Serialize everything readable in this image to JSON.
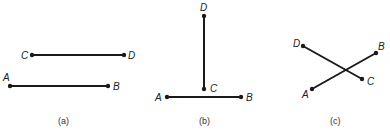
{
  "figure": {
    "panels": [
      {
        "caption": "(a)",
        "caption_pos": [
          65,
          124
        ],
        "segments": [
          {
            "name": "CD",
            "from": "C",
            "to": "D"
          },
          {
            "name": "AB",
            "from": "A",
            "to": "B"
          }
        ],
        "points": {
          "C": {
            "label": "C",
            "x": 32,
            "y": 55,
            "lx": 21,
            "ly": 59
          },
          "D": {
            "label": "D",
            "x": 124,
            "y": 55,
            "lx": 128,
            "ly": 59
          },
          "A": {
            "label": "A",
            "x": 10,
            "y": 86,
            "lx": 3,
            "ly": 81
          },
          "B": {
            "label": "B",
            "x": 108,
            "y": 86,
            "lx": 113,
            "ly": 90
          }
        }
      },
      {
        "caption": "(b)",
        "caption_pos": [
          203,
          124
        ],
        "segments": [
          {
            "name": "DC",
            "from": "D",
            "to": "C"
          },
          {
            "name": "AB",
            "from": "A",
            "to": "B"
          }
        ],
        "points": {
          "D": {
            "label": "D",
            "x": 204,
            "y": 16,
            "lx": 200,
            "ly": 12
          },
          "C": {
            "label": "C",
            "x": 204,
            "y": 89,
            "lx": 210,
            "ly": 92
          },
          "A": {
            "label": "A",
            "x": 167,
            "y": 97,
            "lx": 156,
            "ly": 101
          },
          "B": {
            "label": "B",
            "x": 241,
            "y": 97,
            "lx": 246,
            "ly": 101
          }
        }
      },
      {
        "caption": "(c)",
        "caption_pos": [
          333,
          124
        ],
        "segments": [
          {
            "name": "DC",
            "from": "D",
            "to": "C"
          },
          {
            "name": "AB",
            "from": "A",
            "to": "B"
          }
        ],
        "points": {
          "D": {
            "label": "D",
            "x": 303,
            "y": 46,
            "lx": 293,
            "ly": 47
          },
          "C": {
            "label": "C",
            "x": 362,
            "y": 79,
            "lx": 367,
            "ly": 85
          },
          "A": {
            "label": "A",
            "x": 312,
            "y": 89,
            "lx": 302,
            "ly": 98
          },
          "B": {
            "label": "B",
            "x": 376,
            "y": 53,
            "lx": 378,
            "ly": 50
          }
        }
      }
    ]
  }
}
